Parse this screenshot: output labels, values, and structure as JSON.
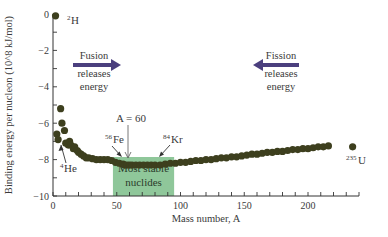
{
  "chart_data": {
    "type": "scatter",
    "title": "",
    "xlabel": "Mass number, A",
    "ylabel": "Binding energy per nucleon (10^8 kJ/mol)",
    "xlim": [
      0,
      240
    ],
    "ylim": [
      -10,
      0
    ],
    "x_major_ticks": [
      0,
      50,
      100,
      150,
      200
    ],
    "x_minor_step": 10,
    "y_major_ticks": [
      0,
      -2,
      -4,
      -6,
      -8,
      -10
    ],
    "y_minor_step": 1,
    "grid": false,
    "point_color": "#3d3f1e",
    "highlight_color": "#8fc79a",
    "arrow_color": "#4b3f7e",
    "points": [
      {
        "x": 2,
        "y": -0.1
      },
      {
        "x": 3,
        "y": -6.6
      },
      {
        "x": 4,
        "y": -6.9
      },
      {
        "x": 6,
        "y": -5.2
      },
      {
        "x": 7,
        "y": -6.0
      },
      {
        "x": 9,
        "y": -6.4
      },
      {
        "x": 10,
        "y": -7.1
      },
      {
        "x": 12,
        "y": -7.2
      },
      {
        "x": 13,
        "y": -7.0
      },
      {
        "x": 14,
        "y": -7.2
      },
      {
        "x": 16,
        "y": -7.4
      },
      {
        "x": 17,
        "y": -7.3
      },
      {
        "x": 19,
        "y": -7.5
      },
      {
        "x": 20,
        "y": -7.6
      },
      {
        "x": 22,
        "y": -7.7
      },
      {
        "x": 24,
        "y": -7.8
      },
      {
        "x": 26,
        "y": -7.9
      },
      {
        "x": 28,
        "y": -7.9
      },
      {
        "x": 31,
        "y": -7.95
      },
      {
        "x": 34,
        "y": -8.0
      },
      {
        "x": 37,
        "y": -8.0
      },
      {
        "x": 40,
        "y": -8.0
      },
      {
        "x": 43,
        "y": -8.0
      },
      {
        "x": 46,
        "y": -8.05
      },
      {
        "x": 49,
        "y": -8.15
      },
      {
        "x": 52,
        "y": -8.2
      },
      {
        "x": 55,
        "y": -8.25
      },
      {
        "x": 56,
        "y": -8.3
      },
      {
        "x": 58,
        "y": -8.3
      },
      {
        "x": 60,
        "y": -8.3
      },
      {
        "x": 62,
        "y": -8.3
      },
      {
        "x": 65,
        "y": -8.3
      },
      {
        "x": 68,
        "y": -8.3
      },
      {
        "x": 71,
        "y": -8.3
      },
      {
        "x": 74,
        "y": -8.3
      },
      {
        "x": 77,
        "y": -8.3
      },
      {
        "x": 80,
        "y": -8.3
      },
      {
        "x": 84,
        "y": -8.3
      },
      {
        "x": 88,
        "y": -8.25
      },
      {
        "x": 92,
        "y": -8.2
      },
      {
        "x": 96,
        "y": -8.2
      },
      {
        "x": 100,
        "y": -8.15
      },
      {
        "x": 104,
        "y": -8.15
      },
      {
        "x": 108,
        "y": -8.1
      },
      {
        "x": 112,
        "y": -8.05
      },
      {
        "x": 116,
        "y": -8.05
      },
      {
        "x": 120,
        "y": -8.0
      },
      {
        "x": 124,
        "y": -8.0
      },
      {
        "x": 128,
        "y": -7.95
      },
      {
        "x": 132,
        "y": -7.9
      },
      {
        "x": 136,
        "y": -7.9
      },
      {
        "x": 140,
        "y": -7.85
      },
      {
        "x": 144,
        "y": -7.85
      },
      {
        "x": 148,
        "y": -7.8
      },
      {
        "x": 152,
        "y": -7.75
      },
      {
        "x": 156,
        "y": -7.7
      },
      {
        "x": 160,
        "y": -7.7
      },
      {
        "x": 164,
        "y": -7.65
      },
      {
        "x": 168,
        "y": -7.6
      },
      {
        "x": 172,
        "y": -7.6
      },
      {
        "x": 176,
        "y": -7.55
      },
      {
        "x": 180,
        "y": -7.55
      },
      {
        "x": 184,
        "y": -7.5
      },
      {
        "x": 188,
        "y": -7.45
      },
      {
        "x": 192,
        "y": -7.45
      },
      {
        "x": 196,
        "y": -7.4
      },
      {
        "x": 200,
        "y": -7.4
      },
      {
        "x": 204,
        "y": -7.35
      },
      {
        "x": 208,
        "y": -7.3
      },
      {
        "x": 212,
        "y": -7.3
      },
      {
        "x": 216,
        "y": -7.25
      },
      {
        "x": 235,
        "y": -7.3
      }
    ],
    "highlight_region": {
      "x_from": 47,
      "x_to": 95,
      "label_line1": "Most stable",
      "label_line2": "nuclides"
    },
    "annotations": {
      "h2": {
        "mass": "2",
        "symbol": "H"
      },
      "he4": {
        "mass": "4",
        "symbol": "He"
      },
      "fe56": {
        "mass": "56",
        "symbol": "Fe"
      },
      "kr84": {
        "mass": "84",
        "symbol": "Kr"
      },
      "u235": {
        "mass": "235",
        "symbol": "U"
      },
      "a60": "A = 60",
      "fusion": {
        "line1": "Fusion",
        "line2": "releases",
        "line3": "energy"
      },
      "fission": {
        "line1": "Fission",
        "line2": "releases",
        "line3": "energy"
      }
    }
  }
}
